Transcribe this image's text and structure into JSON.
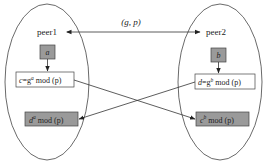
{
  "diagram": {
    "shared_params": {
      "text": "(g, p)",
      "g": "g",
      "p": "p"
    },
    "peers": [
      {
        "id": "peer1",
        "label": "peer1",
        "secret": "a",
        "public_value": {
          "lhs": "c",
          "base": "g",
          "exp": "a",
          "suffix": " mod (p)"
        },
        "shared_key": {
          "base": "d",
          "exp": "a",
          "suffix": " mod (p)"
        }
      },
      {
        "id": "peer2",
        "label": "peer2",
        "secret": "b",
        "public_value": {
          "lhs": "d",
          "base": "g",
          "exp": "b",
          "suffix": " mod (p)"
        },
        "shared_key": {
          "base": "c",
          "exp": "b",
          "suffix": " mod (p)"
        }
      }
    ],
    "edges": [
      {
        "from": "peer1",
        "to": "peer2",
        "label": "(g, p)",
        "bidirectional": true
      },
      {
        "from": "peer1.secret",
        "to": "peer1.public_value"
      },
      {
        "from": "peer2.secret",
        "to": "peer2.public_value"
      },
      {
        "from": "peer1.public_value",
        "to": "peer2.shared_key"
      },
      {
        "from": "peer2.public_value",
        "to": "peer1.shared_key"
      }
    ],
    "colors": {
      "stroke": "#333333",
      "gray_fill": "#9a9a9a",
      "white_fill": "#ffffff"
    }
  }
}
